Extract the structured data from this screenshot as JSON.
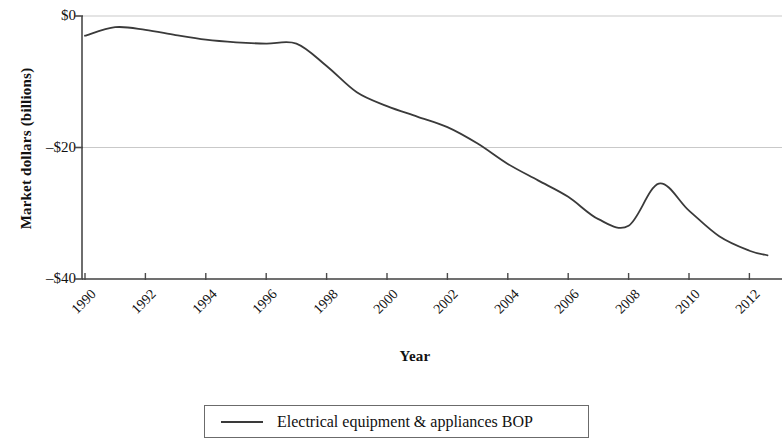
{
  "chart_data": {
    "type": "line",
    "title": "",
    "xlabel": "Year",
    "ylabel": "Market dollars (billions)",
    "xlim": [
      1990,
      2012.6
    ],
    "ylim": [
      -40,
      0
    ],
    "grid": true,
    "grid_axis": "y",
    "legend_position": "bottom",
    "y_tick_labels": [
      "$0",
      "–$20",
      "–$40"
    ],
    "y_tick_values": [
      0,
      -20,
      -40
    ],
    "x_tick_labels": [
      "1990",
      "1992",
      "1994",
      "1996",
      "1998",
      "2000",
      "2002",
      "2004",
      "2006",
      "2008",
      "2010",
      "2012"
    ],
    "x_tick_values": [
      1990,
      1992,
      1994,
      1996,
      1998,
      2000,
      2002,
      2004,
      2006,
      2008,
      2010,
      2012
    ],
    "series": [
      {
        "name": "Electrical equipment & appliances BOP",
        "color": "#3a3a3a",
        "x": [
          1990,
          1991,
          1992,
          1993,
          1994,
          1995,
          1996,
          1997,
          1998,
          1999,
          2000,
          2001,
          2002,
          2003,
          2004,
          2005,
          2006,
          2007,
          2008,
          2009,
          2010,
          2011,
          2012,
          2012.6
        ],
        "values": [
          -3.0,
          -1.7,
          -2.1,
          -2.9,
          -3.6,
          -4.0,
          -4.2,
          -4.2,
          -7.6,
          -11.6,
          -13.7,
          -15.3,
          -16.9,
          -19.4,
          -22.5,
          -25.0,
          -27.5,
          -30.9,
          -31.9,
          -25.5,
          -29.6,
          -33.5,
          -35.7,
          -36.4
        ]
      }
    ],
    "legend_entries": [
      {
        "label": "Electrical equipment & appliances BOP",
        "marker": "line",
        "color": "#3a3a3a"
      }
    ]
  },
  "axes": {
    "y_title": "Market dollars (billions)",
    "x_title": "Year"
  }
}
